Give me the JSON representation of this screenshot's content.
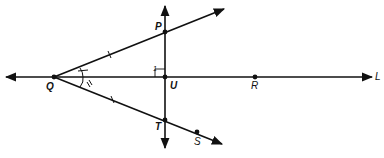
{
  "diagram": {
    "points": {
      "Q": {
        "label": "Q",
        "x": 54,
        "y": 77
      },
      "U": {
        "label": "U",
        "x": 165,
        "y": 77
      },
      "P": {
        "label": "P",
        "x": 165,
        "y": 32
      },
      "T": {
        "label": "T",
        "x": 165,
        "y": 120
      },
      "R": {
        "label": "R",
        "x": 255,
        "y": 77
      },
      "S": {
        "label": "S",
        "x": 197,
        "y": 132
      }
    },
    "line_label": "L",
    "angle_mark_label": "1",
    "stroke_color": "#111111"
  }
}
